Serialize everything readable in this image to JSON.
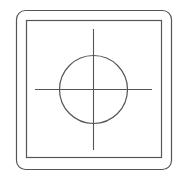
{
  "diagram": {
    "width": 184,
    "height": 178,
    "stroke_color": "#555555",
    "background": "#ffffff",
    "outer_frame": {
      "x": 16.5,
      "y": 10.5,
      "width": 155,
      "height": 159,
      "radius": 9
    },
    "inner_square": {
      "x": 26.5,
      "y": 20.5,
      "width": 135,
      "height": 137
    },
    "circle": {
      "cx": 93.5,
      "cy": 89.5,
      "r": 34
    },
    "crosshair": {
      "horizontal": {
        "x1": 35,
        "y1": 89.5,
        "x2": 152,
        "y2": 89.5
      },
      "vertical": {
        "x1": 93.5,
        "y1": 29,
        "x2": 93.5,
        "y2": 150
      }
    }
  }
}
